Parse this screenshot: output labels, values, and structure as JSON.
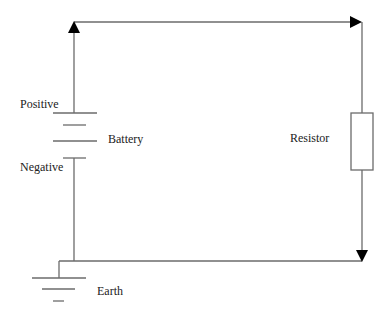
{
  "diagram": {
    "type": "circuit",
    "colors": {
      "wire": "#6b6b6b",
      "arrow": "#000000",
      "text": "#222222"
    },
    "labels": {
      "positive": "Positive",
      "battery": "Battery",
      "negative": "Negative",
      "resistor": "Resistor",
      "earth": "Earth"
    },
    "components": [
      {
        "id": "battery",
        "label": "Battery",
        "terminals": [
          "Positive",
          "Negative"
        ]
      },
      {
        "id": "resistor",
        "label": "Resistor"
      },
      {
        "id": "earth",
        "label": "Earth"
      }
    ],
    "connections": [
      {
        "from": "Positive",
        "to": "Resistor",
        "direction": "up-then-right"
      },
      {
        "from": "Resistor",
        "to": "Earth",
        "direction": "down-then-left"
      },
      {
        "from": "Negative",
        "to": "Earth"
      }
    ]
  }
}
